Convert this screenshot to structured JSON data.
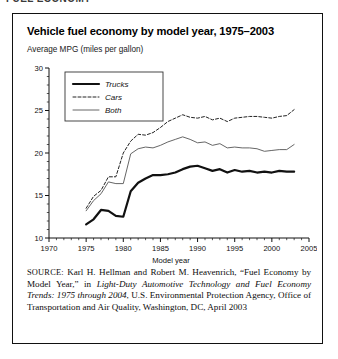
{
  "page": {
    "cut_off_header": "FUEL ECONOMY"
  },
  "figure": {
    "title": "Vehicle fuel economy by model year, 1975–2003",
    "subtitle": "Average MPG (miles per gallon)"
  },
  "source_note": {
    "label": "SOURCE:",
    "part1": " Karl H. Hellman and Robert M. Heavenrich, “Fuel Economy by Model Year,” in ",
    "italic1": "Light-Duty Automotive Technology and Fuel Economy Trends: 1975 through 2004",
    "part2": ", U.S. Environmental Protection Agency, Office of Transportation and Air Quality, Washington, DC, April 2003"
  },
  "chart_data": {
    "type": "line",
    "title": "Vehicle fuel economy by model year, 1975–2003",
    "subtitle": "Average MPG (miles per gallon)",
    "xlabel": "Model year",
    "ylabel": "",
    "xlim": [
      1970,
      2005
    ],
    "ylim": [
      10,
      30
    ],
    "xticks": [
      1970,
      1975,
      1980,
      1985,
      1990,
      1995,
      2000,
      2005
    ],
    "yticks": [
      10,
      15,
      20,
      25,
      30
    ],
    "xminor_step": 1,
    "yminor_step": 1,
    "grid": false,
    "legend_position": "top-left",
    "x": [
      1975,
      1976,
      1977,
      1978,
      1979,
      1980,
      1981,
      1982,
      1983,
      1984,
      1985,
      1986,
      1987,
      1988,
      1989,
      1990,
      1991,
      1992,
      1993,
      1994,
      1995,
      1996,
      1997,
      1998,
      1999,
      2000,
      2001,
      2002,
      2003
    ],
    "series": [
      {
        "name": "Trucks",
        "style": "thick-solid",
        "color": "#111111",
        "values": [
          11.6,
          12.2,
          13.3,
          13.2,
          12.6,
          12.5,
          15.5,
          16.5,
          17.0,
          17.4,
          17.4,
          17.5,
          17.7,
          18.1,
          18.4,
          18.5,
          18.2,
          17.9,
          18.1,
          17.7,
          18.0,
          17.8,
          17.9,
          17.7,
          17.8,
          17.7,
          17.9,
          17.8,
          17.8
        ],
        "units": "MPG"
      },
      {
        "name": "Cars",
        "style": "dashed",
        "color": "#222222",
        "values": [
          13.5,
          14.9,
          15.6,
          17.2,
          17.2,
          20.0,
          21.4,
          22.2,
          22.1,
          22.4,
          23.0,
          23.7,
          24.1,
          24.5,
          24.2,
          24.1,
          24.3,
          23.9,
          24.1,
          23.7,
          24.1,
          24.2,
          24.3,
          24.3,
          24.2,
          24.1,
          24.3,
          24.4,
          25.1
        ],
        "units": "MPG"
      },
      {
        "name": "Both",
        "style": "thin-solid",
        "color": "#555555",
        "values": [
          13.2,
          14.4,
          15.2,
          16.6,
          16.4,
          16.4,
          19.9,
          20.5,
          20.7,
          20.6,
          20.9,
          21.3,
          21.6,
          21.9,
          21.6,
          21.2,
          21.3,
          20.9,
          21.1,
          20.6,
          20.7,
          20.6,
          20.6,
          20.5,
          20.2,
          20.3,
          20.4,
          20.4,
          21.0
        ],
        "units": "MPG"
      }
    ]
  }
}
